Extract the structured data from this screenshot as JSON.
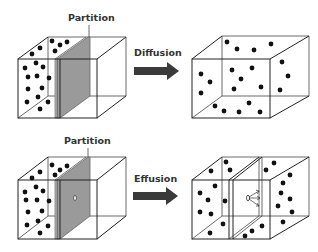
{
  "labels": {
    "partition_top": "Partition",
    "diffusion": "Diffusion",
    "partition_bottom": "Partition",
    "effusion": "Effusion"
  },
  "colors": {
    "partition_fill": "#9a9a9a",
    "partition_edge": "#6e6e6e",
    "arrow": "#3a3a3a",
    "dot": "#111111",
    "line": "#222222"
  },
  "panels": [
    {
      "name": "diffusion-before",
      "description": "Box with partition, gas molecules on left side"
    },
    {
      "name": "diffusion-after",
      "description": "Box without partition, molecules spread evenly"
    },
    {
      "name": "effusion-before",
      "description": "Box with partition containing small pinhole, molecules on left side"
    },
    {
      "name": "effusion-after",
      "description": "Molecules escaping through pinhole into right chamber"
    }
  ]
}
